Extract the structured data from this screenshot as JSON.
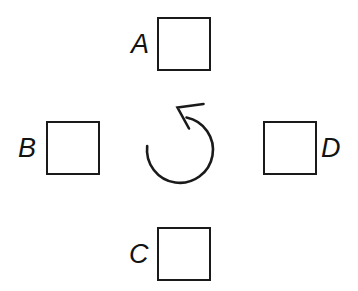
{
  "figure": {
    "title": "Rotation arrangement of four squares",
    "background_color": "#ffffff",
    "stroke_color": "#1a1a1a",
    "width": 358,
    "height": 291
  },
  "nodes": [
    {
      "id": "a",
      "label": "A",
      "position": "top",
      "label_side": "left",
      "shape": "square"
    },
    {
      "id": "b",
      "label": "B",
      "position": "left",
      "label_side": "left",
      "shape": "square"
    },
    {
      "id": "c",
      "label": "C",
      "position": "bottom",
      "label_side": "left",
      "shape": "square"
    },
    {
      "id": "d",
      "label": "D",
      "position": "right",
      "label_side": "right",
      "shape": "square"
    }
  ],
  "rotation_arrow": {
    "icon": "circular-arrow-icon",
    "direction": "counterclockwise",
    "arrowhead": "up-left",
    "center_x": 180,
    "center_y": 149,
    "radius": 33
  }
}
